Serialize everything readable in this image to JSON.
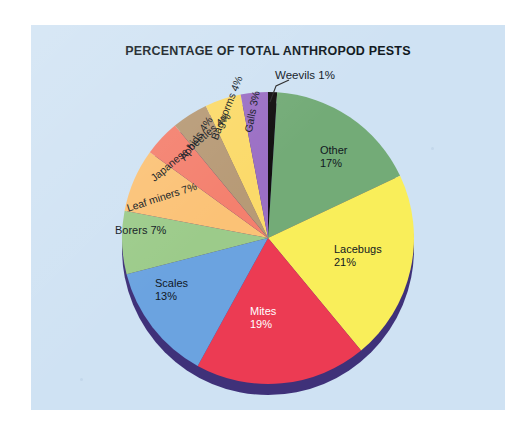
{
  "chart_data": {
    "type": "pie",
    "title": "PERCENTAGE OF TOTAL ANTHROPOD PESTS",
    "xlabel": "",
    "ylabel": "",
    "legend": "none",
    "grid": false,
    "units": "percent",
    "total": 100,
    "categories": [
      "Weevils",
      "Other",
      "Lacebugs",
      "Mites",
      "Scales",
      "Borers",
      "Leaf miners",
      "Japanese beetles",
      "Aphids",
      "Bagworms",
      "Galls"
    ],
    "values": [
      1,
      17,
      21,
      19,
      13,
      7,
      7,
      4,
      4,
      4,
      3
    ],
    "slices": [
      {
        "name": "Weevils",
        "value": 1,
        "label": "Weevils 1%",
        "label_line1": "Weevils 1%",
        "label_line2": "",
        "color": "#120f10",
        "text_color": "#11181f",
        "callout": true
      },
      {
        "name": "Other",
        "value": 17,
        "label": "Other 17%",
        "label_line1": "Other",
        "label_line2": "17%",
        "color": "#73ab77",
        "text_color": "#11181f",
        "callout": false
      },
      {
        "name": "Lacebugs",
        "value": 21,
        "label": "Lacebugs 21%",
        "label_line1": "Lacebugs",
        "label_line2": "21%",
        "color": "#f9ee5a",
        "text_color": "#11181f",
        "callout": false
      },
      {
        "name": "Mites",
        "value": 19,
        "label": "Mites 19%",
        "label_line1": "Mites",
        "label_line2": "19%",
        "color": "#ec3b53",
        "text_color": "#ffffff",
        "callout": false
      },
      {
        "name": "Scales",
        "value": 13,
        "label": "Scales 13%",
        "label_line1": "Scales",
        "label_line2": "13%",
        "color": "#6ba3e0",
        "text_color": "#11181f",
        "callout": false
      },
      {
        "name": "Borers",
        "value": 7,
        "label": "Borers 7%",
        "label_line1": "Borers 7%",
        "label_line2": "",
        "color": "#9ccb8a",
        "text_color": "#11181f",
        "callout": false
      },
      {
        "name": "Leaf miners",
        "value": 7,
        "label": "Leaf miners 7%",
        "label_line1": "Leaf miners 7%",
        "label_line2": "",
        "color": "#fbc276",
        "text_color": "#11181f",
        "callout": false
      },
      {
        "name": "Japanese beetles",
        "value": 4,
        "label": "Japanese beetles 4%",
        "label_line1": "Japanese beetles 4%",
        "label_line2": "",
        "color": "#f4806e",
        "text_color": "#11181f",
        "callout": false
      },
      {
        "name": "Aphids",
        "value": 4,
        "label": "Aphids 4%",
        "label_line1": "Aphids 4%",
        "label_line2": "",
        "color": "#b79a76",
        "text_color": "#11181f",
        "callout": false
      },
      {
        "name": "Bagworms",
        "value": 4,
        "label": "Bagworms 4%",
        "label_line1": "Bagworms 4%",
        "label_line2": "",
        "color": "#fbda6a",
        "text_color": "#11181f",
        "callout": false
      },
      {
        "name": "Galls",
        "value": 3,
        "label": "Galls 3%",
        "label_line1": "Galls 3%",
        "label_line2": "",
        "color": "#9b6fc4",
        "text_color": "#11181f",
        "callout": false
      }
    ],
    "style": {
      "background_color": "#cfe2f3",
      "page_color": "#ffffff",
      "depth_rim_color": "#3f3179",
      "title_color": "#101820",
      "start_angle_deg": -90,
      "direction": "clockwise",
      "three_d": true
    }
  },
  "callouts": [
    {
      "name": "weevils-callout",
      "text": "Weevils 1%"
    }
  ]
}
